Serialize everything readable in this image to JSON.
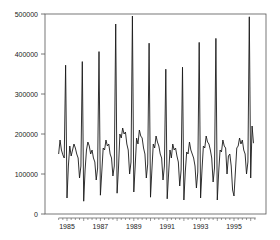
{
  "chart_data": {
    "type": "line",
    "title": "",
    "xlabel": "",
    "ylabel": "",
    "ylim": [
      0,
      500000
    ],
    "xlim": [
      1984.0,
      1996.9
    ],
    "grid": false,
    "legend": null,
    "yticks": [
      0,
      100000,
      200000,
      300000,
      400000,
      500000
    ],
    "ytick_labels": [
      "0",
      "100000",
      "200000",
      "300000",
      "400000",
      "500000"
    ],
    "xticks": [
      1985,
      1987,
      1989,
      1991,
      1993,
      1995
    ],
    "xtick_labels": [
      "1985",
      "1987",
      "1989",
      "1991",
      "1993",
      "1995"
    ],
    "x_start": 1984.5,
    "x_step": 0.08333,
    "series": [
      {
        "name": "monthly series",
        "frequency": "monthly",
        "start": "1984-07",
        "values": [
          150000,
          185000,
          160000,
          148000,
          140000,
          372000,
          40000,
          120000,
          170000,
          145000,
          160000,
          175000,
          165000,
          150000,
          140000,
          90000,
          120000,
          381000,
          32000,
          110000,
          160000,
          180000,
          170000,
          150000,
          160000,
          140000,
          130000,
          85000,
          115000,
          406000,
          47000,
          105000,
          165000,
          160000,
          185000,
          170000,
          175000,
          150000,
          140000,
          95000,
          120000,
          475000,
          52000,
          115000,
          200000,
          190000,
          215000,
          200000,
          205000,
          175000,
          160000,
          100000,
          130000,
          495000,
          55000,
          120000,
          190000,
          175000,
          210000,
          195000,
          190000,
          165000,
          150000,
          90000,
          125000,
          427000,
          42000,
          110000,
          175000,
          165000,
          195000,
          180000,
          170000,
          150000,
          140000,
          85000,
          120000,
          362000,
          38000,
          100000,
          160000,
          140000,
          175000,
          160000,
          165000,
          145000,
          130000,
          70000,
          110000,
          367000,
          35000,
          105000,
          155000,
          150000,
          180000,
          160000,
          150000,
          140000,
          120000,
          65000,
          105000,
          429000,
          40000,
          110000,
          170000,
          165000,
          195000,
          180000,
          175000,
          160000,
          140000,
          80000,
          115000,
          439000,
          35000,
          105000,
          160000,
          155000,
          185000,
          170000,
          165000,
          100000,
          145000,
          150000,
          120000,
          60000,
          45000,
          105000,
          165000,
          170000,
          190000,
          175000,
          185000,
          160000,
          150000,
          100000,
          130000,
          493000,
          90000,
          220000,
          177000
        ]
      }
    ]
  }
}
